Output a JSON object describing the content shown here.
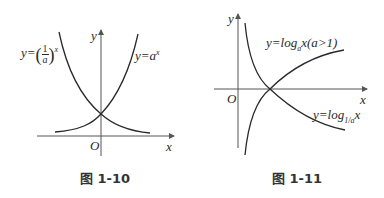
{
  "figures": [
    {
      "caption": "图 1-10",
      "axes": {
        "x_label": "x",
        "y_label": "y",
        "origin_label": "O"
      },
      "curves": [
        {
          "name": "exp-a",
          "label_prefix": "y=a",
          "label_sup": "x"
        },
        {
          "name": "exp-1-over-a",
          "label_prefix": "y=",
          "frac_num": "1",
          "frac_den": "a",
          "label_sup": "x"
        }
      ]
    },
    {
      "caption": "图 1-11",
      "axes": {
        "x_label": "x",
        "y_label": "y",
        "origin_label": "O"
      },
      "curves": [
        {
          "name": "log-a",
          "label_prefix": "y=log",
          "label_sub": "a",
          "label_suffix": "x(a>1)"
        },
        {
          "name": "log-1-over-a",
          "label_prefix": "y=log",
          "label_sub": "1/a",
          "label_suffix": "x"
        }
      ]
    }
  ],
  "colors": {
    "curve": "#2a2a2a",
    "axis": "#555555",
    "background": "#ffffff"
  }
}
